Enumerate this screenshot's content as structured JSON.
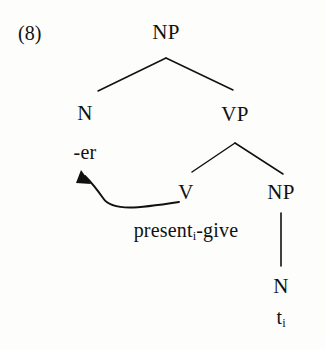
{
  "figure": {
    "example_number": "(8)",
    "background_color": "#fdfdfc",
    "ink_color": "#111111",
    "width": 325,
    "height": 350
  },
  "tree": {
    "nodes": {
      "root_np": {
        "label": "NP",
        "x": 166,
        "y": 32
      },
      "n_left": {
        "label": "N",
        "x": 85,
        "y": 113
      },
      "affix_er": {
        "label": "-er",
        "x": 85,
        "y": 152
      },
      "vp": {
        "label": "VP",
        "x": 235,
        "y": 114
      },
      "v": {
        "label": "V",
        "x": 186,
        "y": 192
      },
      "v_terminal": {
        "label_text": "present",
        "label_sub": "i",
        "label_tail": "-give",
        "x": 186,
        "y": 231
      },
      "object_np": {
        "label": "NP",
        "x": 281,
        "y": 192
      },
      "n_right": {
        "label": "N",
        "x": 281,
        "y": 286
      },
      "trace": {
        "label_text": "t",
        "label_sub": "i",
        "x": 281,
        "y": 318
      }
    },
    "edges": [
      {
        "name": "np-to-n",
        "from": "root_np",
        "to": "n_left",
        "x1": 166,
        "y1": 58,
        "x2": 98,
        "y2": 91
      },
      {
        "name": "np-to-vp",
        "from": "root_np",
        "to": "vp",
        "x1": 166,
        "y1": 58,
        "x2": 233,
        "y2": 90
      },
      {
        "name": "vp-to-v",
        "from": "vp",
        "to": "v",
        "x1": 235,
        "y1": 143,
        "x2": 192,
        "y2": 172
      },
      {
        "name": "vp-to-np",
        "from": "vp",
        "to": "object_np",
        "x1": 235,
        "y1": 143,
        "x2": 283,
        "y2": 174
      },
      {
        "name": "np-to-n-right",
        "from": "object_np",
        "to": "n_right",
        "x1": 281,
        "y1": 213,
        "x2": 281,
        "y2": 266
      }
    ],
    "movement_arrow": {
      "name": "head-movement-arrow",
      "from": "v_terminal",
      "to": "affix_er",
      "path": "M 179 202 C 140 208 112 212 103 198 C 94 186 88 180 83 174",
      "arrowhead_tip_x": 82,
      "arrowhead_tip_y": 171
    }
  }
}
